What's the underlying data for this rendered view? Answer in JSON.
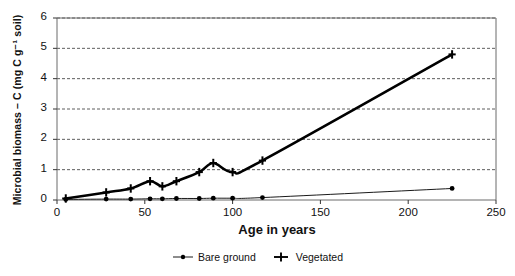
{
  "chart_data": {
    "type": "line",
    "title": "",
    "xlabel": "Age in years",
    "ylabel": "Microbial biomass – C (mg C g⁻¹ soil)",
    "xlim": [
      0,
      250
    ],
    "ylim": [
      0,
      6
    ],
    "xticks": [
      0,
      50,
      100,
      150,
      200,
      250
    ],
    "yticks": [
      0,
      1,
      2,
      3,
      4,
      5,
      6
    ],
    "xtick_labels": [
      "0",
      "50",
      "100",
      "150",
      "200",
      "250"
    ],
    "ytick_labels": [
      "0",
      "1",
      "2",
      "3",
      "4",
      "5",
      "6"
    ],
    "grid": "horizontal-dashed",
    "legend_position": "bottom-center",
    "series": [
      {
        "name": "Bare ground",
        "marker": "dot",
        "line_width": "thin",
        "color": "#000000",
        "x": [
          5,
          28,
          42,
          53,
          60,
          68,
          81,
          89,
          100,
          117,
          225
        ],
        "y": [
          0.02,
          0.03,
          0.03,
          0.04,
          0.04,
          0.05,
          0.05,
          0.06,
          0.06,
          0.08,
          0.38
        ]
      },
      {
        "name": "Vegetated",
        "marker": "plus",
        "line_width": "thick",
        "color": "#000000",
        "x": [
          5,
          28,
          42,
          53,
          60,
          68,
          81,
          89,
          100,
          117,
          225
        ],
        "y": [
          0.05,
          0.25,
          0.38,
          0.62,
          0.45,
          0.62,
          0.92,
          1.22,
          0.92,
          1.3,
          4.8
        ]
      }
    ]
  },
  "axis": {
    "y_label": "Microbial biomass – C (mg C g⁻¹ soil)",
    "x_label": "Age in years"
  },
  "legend": {
    "items": [
      {
        "label": "Bare ground",
        "marker": "dot-marker"
      },
      {
        "label": "Vegetated",
        "marker": "plus-marker"
      }
    ]
  }
}
